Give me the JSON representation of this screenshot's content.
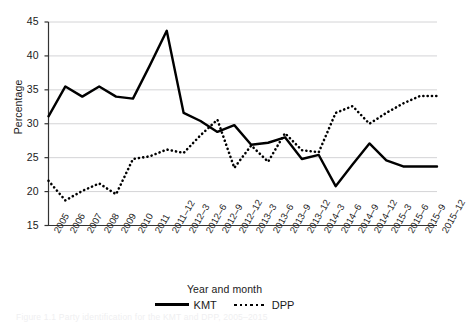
{
  "chart_data": {
    "type": "line",
    "title": "",
    "xlabel": "Year and month",
    "ylabel": "Percentage",
    "ylim": [
      15,
      45
    ],
    "yticks": [
      15,
      20,
      25,
      30,
      35,
      40,
      45
    ],
    "grid": true,
    "legend_position": "bottom",
    "categories": [
      "2005",
      "2006",
      "2007",
      "2008",
      "2009",
      "2010",
      "2011",
      "2011–12",
      "2012–3",
      "2012–6",
      "2012–9",
      "2012–12",
      "2013–3",
      "2013–6",
      "2013–9",
      "2013–12",
      "2014–3",
      "2014–6",
      "2014–9",
      "2014–12",
      "2015–3",
      "2015–6",
      "2015–9",
      "2015–12"
    ],
    "series": [
      {
        "name": "KMT",
        "style": "solid",
        "color": "#000000",
        "values": [
          31.1,
          35.5,
          34.0,
          35.5,
          34.0,
          33.7,
          38.6,
          43.7,
          31.6,
          30.4,
          28.8,
          29.8,
          26.9,
          27.2,
          28.0,
          24.8,
          25.4,
          20.8,
          24.0,
          27.1,
          24.6,
          23.7,
          23.7,
          23.7
        ]
      },
      {
        "name": "DPP",
        "style": "dotted",
        "color": "#000000",
        "values": [
          21.6,
          18.7,
          20.1,
          21.2,
          19.6,
          24.8,
          25.2,
          26.2,
          25.7,
          28.3,
          30.6,
          23.5,
          26.8,
          24.4,
          28.6,
          26.1,
          25.8,
          31.6,
          32.6,
          30.0,
          31.6,
          33.0,
          34.1,
          34.1
        ]
      }
    ]
  },
  "axes": {
    "y_title": "Percentage",
    "x_title": "Year and month",
    "y_tick_labels": [
      "45",
      "40",
      "35",
      "30",
      "25",
      "20",
      "15"
    ]
  },
  "legend": {
    "entries": [
      {
        "label": "KMT",
        "style": "solid"
      },
      {
        "label": "DPP",
        "style": "dotted"
      }
    ]
  },
  "watermark": {
    "text": "Figure 1.1 Party identification for the KMT and DPP, 2005–2015"
  }
}
